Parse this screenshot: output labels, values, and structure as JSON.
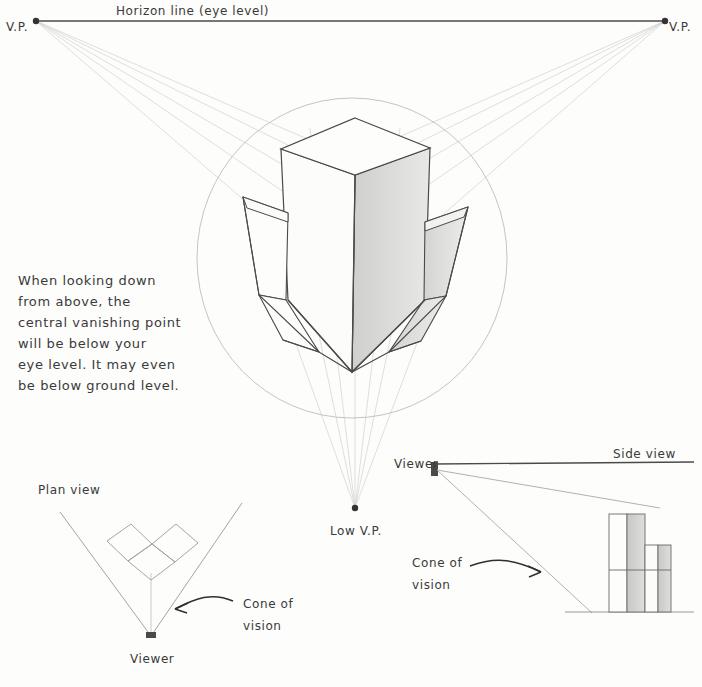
{
  "sheet": {
    "title": "Three-point perspective construction — looking down",
    "paper_color": "#fdfdfc",
    "ink_color": "#3a3a3a",
    "construction_line_color": "#c9c9c9",
    "shading_color": "#d8d8d6"
  },
  "horizon": {
    "label": "Horizon line (eye level)",
    "left_vp_label": "V.P.",
    "right_vp_label": "V.P."
  },
  "caption": {
    "lines": [
      "When looking down",
      "from above, the",
      "central vanishing point",
      "will be below your",
      "eye level. It may even",
      "be below ground level."
    ]
  },
  "main_drawing": {
    "low_vp_label": "Low V.P.",
    "cone_of_vision_circle": true
  },
  "plan_view": {
    "title": "Plan view",
    "viewer_label": "Viewer",
    "cone_label_lines": [
      "Cone of",
      "vision"
    ]
  },
  "side_view": {
    "title": "Side view",
    "viewer_label": "Viewer",
    "cone_label_lines": [
      "Cone of",
      "vision"
    ]
  }
}
